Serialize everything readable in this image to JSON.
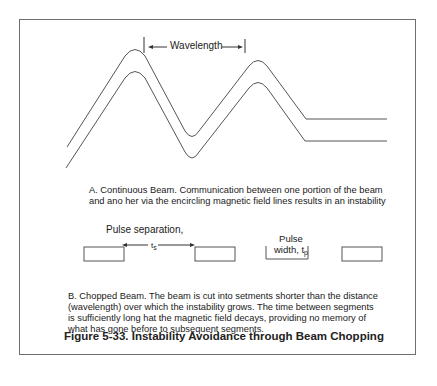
{
  "figure": {
    "title": "Figure 5-33.  Instability Avoidance through Beam Chopping",
    "panel_a": {
      "label": "Wavelength",
      "caption_line1": "A.  Continuous Beam.  Communication between one portion of the beam",
      "caption_line2": "and ano her via the encircling magnetic field lines results in an instability"
    },
    "panel_b": {
      "pulse_separation_label": "Pulse separation,",
      "pulse_separation_symbol": "t",
      "pulse_separation_subscript": "s",
      "pulse_width_label_line1": "Pulse",
      "pulse_width_label_line2": "width, t",
      "pulse_width_subscript": "p",
      "caption_line1": "B.  Chopped Beam.  The beam is cut into setments shorter than the distance",
      "caption_line2": "(wavelength) over which the instability grows.  The time between segments",
      "caption_line3": "is sufficiently long  hat the magnetic field decays, providing no memory of",
      "caption_line4": "what has gone before to subsequent segments."
    },
    "colors": {
      "line": "#555555",
      "frame": "#6e6e6e",
      "text": "#1a1a1a"
    }
  }
}
